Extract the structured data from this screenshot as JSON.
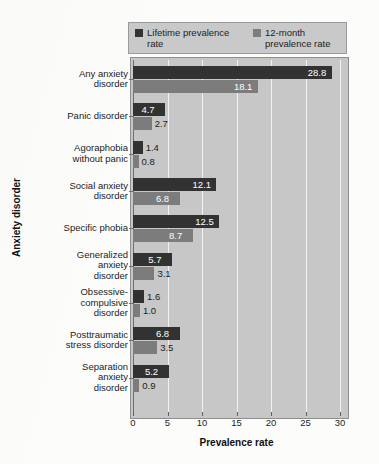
{
  "chart_data": {
    "type": "bar",
    "orientation": "horizontal",
    "title": "",
    "xlabel": "Prevalence rate",
    "ylabel": "Anxiety disorder",
    "xlim": [
      0,
      30
    ],
    "xticks": [
      0,
      5,
      10,
      15,
      20,
      25,
      30
    ],
    "grid": true,
    "legend_position": "top",
    "categories": [
      "Any anxiety\ndisorder",
      "Panic disorder",
      "Agoraphobia\nwithout panic",
      "Social anxiety\ndisorder",
      "Specific phobia",
      "Generalized\nanxiety\ndisorder",
      "Obsessive-\ncompulsive\ndisorder",
      "Posttraumatic\nstress disorder",
      "Separation\nanxiety\ndisorder"
    ],
    "series": [
      {
        "name": "Lifetime prevalence\nrate",
        "color": "#323232",
        "values": [
          28.8,
          4.7,
          1.4,
          12.1,
          12.5,
          5.7,
          1.6,
          6.8,
          5.2
        ],
        "labels": [
          "28.8",
          "4.7",
          "1.4",
          "12.1",
          "12.5",
          "5.7",
          "1.6",
          "6.8",
          "5.2"
        ]
      },
      {
        "name": "12-month\nprevalence rate",
        "color": "#7c7c7c",
        "values": [
          18.1,
          2.7,
          0.8,
          6.8,
          8.7,
          3.1,
          1.0,
          3.5,
          0.9
        ],
        "labels": [
          "18.1",
          "2.7",
          "0.8",
          "6.8",
          "8.7",
          "3.1",
          "1.0",
          "3.5",
          "0.9"
        ]
      }
    ]
  },
  "legend": {
    "entries": [
      {
        "label": "Lifetime prevalence\nrate",
        "swatch": "#323232"
      },
      {
        "label": "12-month\nprevalence rate",
        "swatch": "#7c7c7c"
      }
    ]
  },
  "axes": {
    "x_title": "Prevalence rate",
    "y_title": "Anxiety disorder",
    "x_tick_labels": [
      "0",
      "5",
      "10",
      "15",
      "20",
      "25",
      "30"
    ]
  },
  "colors": {
    "lifetime": "#323232",
    "month12": "#7c7c7c",
    "plot_background": "#c7c7c7",
    "gridline": "#f2f2f2",
    "page_background": "#fcfcfb"
  }
}
